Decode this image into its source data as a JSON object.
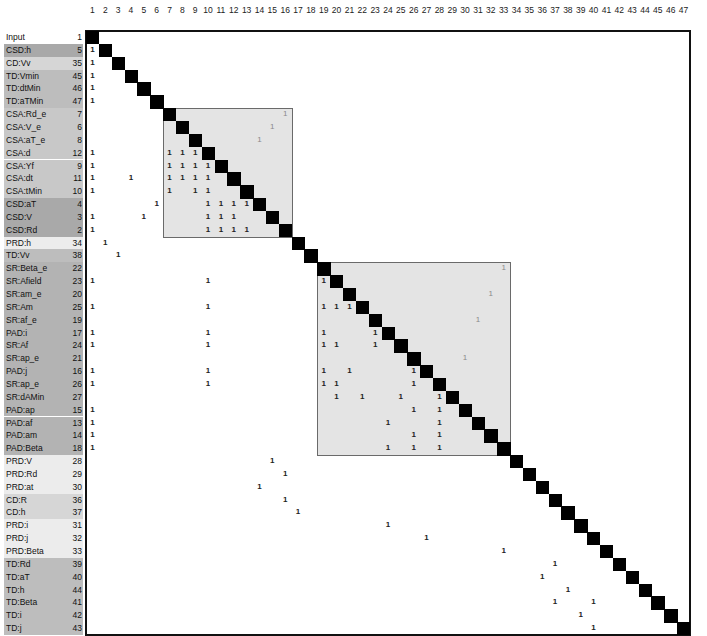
{
  "matrix": {
    "size": 47,
    "columns": [
      "1",
      "2",
      "3",
      "4",
      "5",
      "6",
      "7",
      "8",
      "9",
      "10",
      "11",
      "12",
      "13",
      "14",
      "15",
      "16",
      "17",
      "18",
      "19",
      "20",
      "21",
      "22",
      "23",
      "24",
      "25",
      "26",
      "27",
      "28",
      "29",
      "30",
      "31",
      "32",
      "33",
      "34",
      "35",
      "36",
      "37",
      "38",
      "39",
      "40",
      "41",
      "42",
      "43",
      "44",
      "45",
      "46",
      "47"
    ],
    "rows": [
      {
        "label": "Input",
        "index": "1",
        "color": "#ffffff"
      },
      {
        "label": "CSD:h",
        "index": "5",
        "color": "#a9a9a9"
      },
      {
        "label": "CD:Vv",
        "index": "35",
        "color": "#d6d6d6"
      },
      {
        "label": "TD:Vmin",
        "index": "45",
        "color": "#bdbdbd"
      },
      {
        "label": "TD:dtMin",
        "index": "46",
        "color": "#bdbdbd"
      },
      {
        "label": "TD:aTMin",
        "index": "47",
        "color": "#bdbdbd"
      },
      {
        "label": "CSA:Rd_e",
        "index": "7",
        "color": "#c8c8c8"
      },
      {
        "label": "CSA:V_e",
        "index": "6",
        "color": "#c8c8c8"
      },
      {
        "label": "CSA:aT_e",
        "index": "8",
        "color": "#c8c8c8"
      },
      {
        "label": "CSA:d",
        "index": "12",
        "color": "#c8c8c8"
      },
      {
        "label": "CSA:Yf",
        "index": "9",
        "color": "#c8c8c8"
      },
      {
        "label": "CSA:dt",
        "index": "11",
        "color": "#c8c8c8"
      },
      {
        "label": "CSA:tMin",
        "index": "10",
        "color": "#c8c8c8"
      },
      {
        "label": "CSD:aT",
        "index": "4",
        "color": "#a9a9a9"
      },
      {
        "label": "CSD:V",
        "index": "3",
        "color": "#a9a9a9"
      },
      {
        "label": "CSD:Rd",
        "index": "2",
        "color": "#a9a9a9"
      },
      {
        "label": "PRD:h",
        "index": "34",
        "color": "#ececec"
      },
      {
        "label": "TD:Vv",
        "index": "38",
        "color": "#bdbdbd"
      },
      {
        "label": "SR:Beta_e",
        "index": "22",
        "color": "#b3b3b3"
      },
      {
        "label": "SR:Afield",
        "index": "23",
        "color": "#b3b3b3"
      },
      {
        "label": "SR:am_e",
        "index": "20",
        "color": "#b3b3b3"
      },
      {
        "label": "SR:Am",
        "index": "25",
        "color": "#b3b3b3"
      },
      {
        "label": "SR:af_e",
        "index": "19",
        "color": "#b3b3b3"
      },
      {
        "label": "PAD:i",
        "index": "17",
        "color": "#b3b3b3"
      },
      {
        "label": "SR:Af",
        "index": "24",
        "color": "#b3b3b3"
      },
      {
        "label": "SR:ap_e",
        "index": "21",
        "color": "#b3b3b3"
      },
      {
        "label": "PAD:j",
        "index": "16",
        "color": "#b3b3b3"
      },
      {
        "label": "SR:ap_e",
        "index": "26",
        "color": "#b3b3b3"
      },
      {
        "label": "SR:dAMin",
        "index": "27",
        "color": "#b3b3b3"
      },
      {
        "label": "PAD:ap",
        "index": "15",
        "color": "#b3b3b3"
      },
      {
        "label": "PAD:af",
        "index": "13",
        "color": "#b3b3b3"
      },
      {
        "label": "PAD:am",
        "index": "14",
        "color": "#b3b3b3"
      },
      {
        "label": "PAD:Beta",
        "index": "18",
        "color": "#b3b3b3"
      },
      {
        "label": "PRD:V",
        "index": "28",
        "color": "#ececec"
      },
      {
        "label": "PRD:Rd",
        "index": "29",
        "color": "#ececec"
      },
      {
        "label": "PRD:at",
        "index": "30",
        "color": "#ececec"
      },
      {
        "label": "CD:R",
        "index": "36",
        "color": "#d6d6d6"
      },
      {
        "label": "CD:h",
        "index": "37",
        "color": "#d6d6d6"
      },
      {
        "label": "PRD:i",
        "index": "31",
        "color": "#ececec"
      },
      {
        "label": "PRD:j",
        "index": "32",
        "color": "#ececec"
      },
      {
        "label": "PRD:Beta",
        "index": "33",
        "color": "#ececec"
      },
      {
        "label": "TD:Rd",
        "index": "39",
        "color": "#bdbdbd"
      },
      {
        "label": "TD:aT",
        "index": "40",
        "color": "#bdbdbd"
      },
      {
        "label": "TD:h",
        "index": "44",
        "color": "#bdbdbd"
      },
      {
        "label": "TD:Beta",
        "index": "41",
        "color": "#bdbdbd"
      },
      {
        "label": "TD:i",
        "index": "42",
        "color": "#bdbdbd"
      },
      {
        "label": "TD:j",
        "index": "43",
        "color": "#bdbdbd"
      }
    ],
    "blocks": [
      {
        "name": "csa-block",
        "start": 7,
        "end": 16
      },
      {
        "name": "sr-pad-block",
        "start": 19,
        "end": 33
      }
    ],
    "marks": [
      [
        2,
        1
      ],
      [
        3,
        1
      ],
      [
        4,
        1
      ],
      [
        5,
        1
      ],
      [
        6,
        1
      ],
      [
        10,
        1
      ],
      [
        10,
        7
      ],
      [
        10,
        8
      ],
      [
        10,
        9
      ],
      [
        11,
        1
      ],
      [
        11,
        7
      ],
      [
        11,
        8
      ],
      [
        11,
        9
      ],
      [
        11,
        10
      ],
      [
        12,
        1
      ],
      [
        12,
        4
      ],
      [
        12,
        7
      ],
      [
        12,
        8
      ],
      [
        12,
        9
      ],
      [
        12,
        10
      ],
      [
        13,
        1
      ],
      [
        13,
        7
      ],
      [
        13,
        9
      ],
      [
        13,
        10
      ],
      [
        14,
        6
      ],
      [
        14,
        10
      ],
      [
        14,
        11
      ],
      [
        14,
        12
      ],
      [
        14,
        13
      ],
      [
        15,
        1
      ],
      [
        15,
        5
      ],
      [
        15,
        10
      ],
      [
        15,
        11
      ],
      [
        15,
        12
      ],
      [
        16,
        1
      ],
      [
        16,
        10
      ],
      [
        16,
        11
      ],
      [
        16,
        12
      ],
      [
        16,
        13
      ],
      [
        17,
        2
      ],
      [
        18,
        3
      ],
      [
        20,
        1
      ],
      [
        20,
        10
      ],
      [
        20,
        19
      ],
      [
        22,
        1
      ],
      [
        22,
        10
      ],
      [
        22,
        19
      ],
      [
        22,
        20
      ],
      [
        22,
        21
      ],
      [
        24,
        1
      ],
      [
        24,
        10
      ],
      [
        24,
        19
      ],
      [
        24,
        23
      ],
      [
        25,
        1
      ],
      [
        25,
        10
      ],
      [
        25,
        19
      ],
      [
        25,
        20
      ],
      [
        25,
        23
      ],
      [
        27,
        1
      ],
      [
        27,
        10
      ],
      [
        27,
        19
      ],
      [
        27,
        21
      ],
      [
        27,
        26
      ],
      [
        28,
        1
      ],
      [
        28,
        10
      ],
      [
        28,
        19
      ],
      [
        28,
        20
      ],
      [
        28,
        26
      ],
      [
        29,
        20
      ],
      [
        29,
        22
      ],
      [
        29,
        25
      ],
      [
        29,
        28
      ],
      [
        30,
        1
      ],
      [
        30,
        26
      ],
      [
        30,
        28
      ],
      [
        31,
        1
      ],
      [
        31,
        24
      ],
      [
        31,
        28
      ],
      [
        32,
        1
      ],
      [
        32,
        26
      ],
      [
        32,
        28
      ],
      [
        33,
        1
      ],
      [
        33,
        24
      ],
      [
        33,
        26
      ],
      [
        33,
        28
      ],
      [
        34,
        15
      ],
      [
        35,
        16
      ],
      [
        36,
        14
      ],
      [
        37,
        16
      ],
      [
        38,
        17
      ],
      [
        39,
        24
      ],
      [
        40,
        27
      ],
      [
        41,
        33
      ],
      [
        42,
        37
      ],
      [
        43,
        36
      ],
      [
        44,
        38
      ],
      [
        45,
        37
      ],
      [
        45,
        40
      ],
      [
        46,
        39
      ],
      [
        47,
        40
      ]
    ],
    "light_marks": [
      [
        7,
        16
      ],
      [
        8,
        15
      ],
      [
        9,
        14
      ],
      [
        19,
        33
      ],
      [
        21,
        32
      ],
      [
        23,
        31
      ],
      [
        26,
        30
      ]
    ],
    "mark_text": "1",
    "colors": {
      "diagonal": "#000000",
      "block_fill": "#e4e4e4",
      "block_border": "#6a6a6a",
      "frame": "#111111"
    }
  }
}
